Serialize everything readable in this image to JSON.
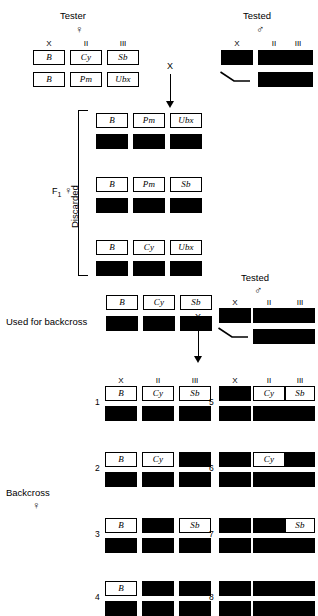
{
  "figure": {
    "chromosome_headers": [
      "X",
      "II",
      "III"
    ],
    "symbols": {
      "female": "♀",
      "male": "♂",
      "cross": "X"
    }
  },
  "tester": {
    "label": "Tester",
    "sex": "♀",
    "headers": [
      "X",
      "II",
      "III"
    ],
    "top_row": [
      "B",
      "Cy",
      "Sb"
    ],
    "bottom_row": [
      "B",
      "Pm",
      "Ubx"
    ]
  },
  "tested_top": {
    "label": "Tested",
    "sex": "♂",
    "headers": [
      "X",
      "II",
      "III"
    ],
    "top_row": [
      "■",
      "■",
      "■"
    ],
    "bottom_row": [
      "Y",
      "■",
      "■"
    ]
  },
  "cross1": {
    "symbol": "X"
  },
  "f1": {
    "label": "F",
    "subscript": "1",
    "sex": "♀",
    "bracket_label": "Discarded",
    "genotypes": [
      {
        "top": [
          "B",
          "Pm",
          "Ubx"
        ],
        "bottom": [
          "■",
          "■",
          "■"
        ]
      },
      {
        "top": [
          "B",
          "Pm",
          "Sb"
        ],
        "bottom": [
          "■",
          "■",
          "■"
        ]
      },
      {
        "top": [
          "B",
          "Cy",
          "Ubx"
        ],
        "bottom": [
          "■",
          "■",
          "■"
        ]
      }
    ]
  },
  "used_for_backcross": {
    "label": "Used for backcross",
    "top_row": [
      "B",
      "Cy",
      "Sb"
    ],
    "bottom_row": [
      "■",
      "■",
      "■"
    ]
  },
  "tested_mid": {
    "label": "Tested",
    "sex": "♂",
    "headers": [
      "X",
      "II",
      "III"
    ],
    "top_row": [
      "■",
      "■",
      "■"
    ],
    "bottom_row": [
      "Y",
      "■",
      "■"
    ]
  },
  "cross2": {
    "symbol": "X"
  },
  "backcross": {
    "label": "Backcross",
    "sex": "♀",
    "headers": [
      "X",
      "II",
      "III"
    ],
    "classes": [
      {
        "number": "1",
        "top": [
          "B",
          "Cy",
          "Sb"
        ],
        "bottom": [
          "■",
          "■",
          "■"
        ]
      },
      {
        "number": "2",
        "top": [
          "B",
          "Cy",
          "■"
        ],
        "bottom": [
          "■",
          "■",
          "■"
        ]
      },
      {
        "number": "3",
        "top": [
          "B",
          "■",
          "Sb"
        ],
        "bottom": [
          "■",
          "■",
          "■"
        ]
      },
      {
        "number": "4",
        "top": [
          "B",
          "■",
          "■"
        ],
        "bottom": [
          "■",
          "■",
          "■"
        ]
      },
      {
        "number": "5",
        "top": [
          "■",
          "Cy",
          "Sb"
        ],
        "bottom": [
          "■",
          "■",
          "■"
        ]
      },
      {
        "number": "6",
        "top": [
          "■",
          "Cy",
          "■"
        ],
        "bottom": [
          "■",
          "■",
          "■"
        ]
      },
      {
        "number": "7",
        "top": [
          "■",
          "■",
          "Sb"
        ],
        "bottom": [
          "■",
          "■",
          "■"
        ]
      },
      {
        "number": "8",
        "top": [
          "■",
          "■",
          "■"
        ],
        "bottom": [
          "■",
          "■",
          "■"
        ]
      }
    ]
  }
}
